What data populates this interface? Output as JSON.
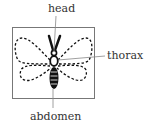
{
  "diagram": {
    "labels": {
      "head": "head",
      "thorax": "thorax",
      "abdomen": "abdomen"
    },
    "colors": {
      "frame": "#777777",
      "ink": "#111111",
      "leader": "#888888",
      "text": "#333333"
    }
  }
}
